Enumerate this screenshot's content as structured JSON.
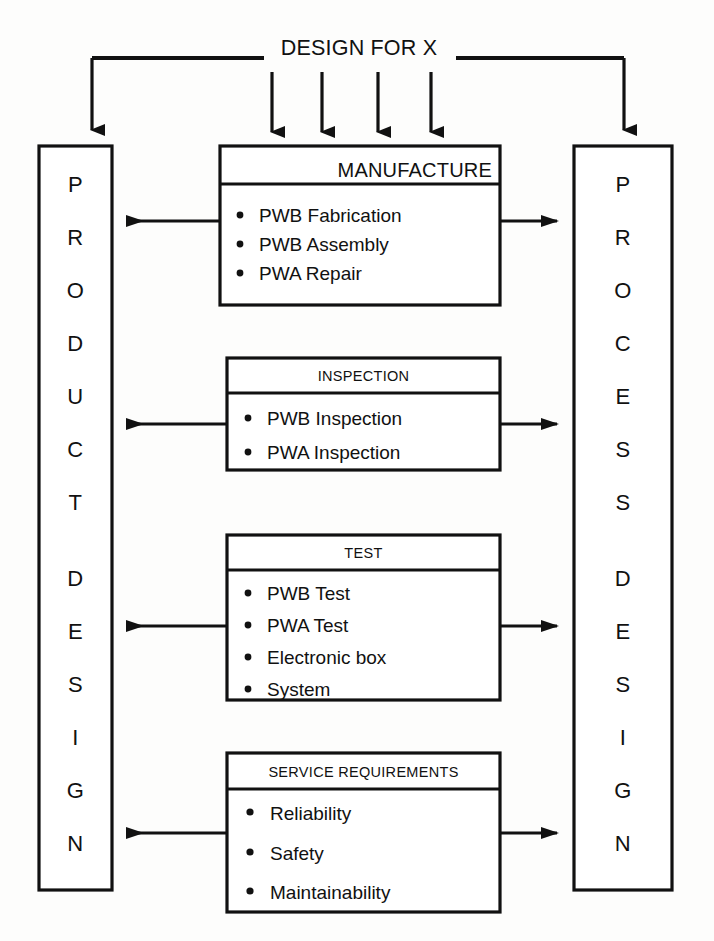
{
  "diagram": {
    "title": "DESIGN FOR X",
    "left_column": {
      "name": "product-design-column",
      "label": "PRODUCT DESIGN",
      "letters": [
        "P",
        "R",
        "O",
        "D",
        "U",
        "C",
        "T",
        "D",
        "E",
        "S",
        "I",
        "G",
        "N"
      ]
    },
    "right_column": {
      "name": "process-design-column",
      "label": "PROCESS DESIGN",
      "letters": [
        "P",
        "R",
        "O",
        "C",
        "E",
        "S",
        "S",
        "D",
        "E",
        "S",
        "I",
        "G",
        "N"
      ]
    },
    "center_boxes": [
      {
        "header": "MANUFACTURE",
        "header_align": "right",
        "header_size": "large",
        "items": [
          "PWB Fabrication",
          "PWB Assembly",
          "PWA Repair"
        ]
      },
      {
        "header": "INSPECTION",
        "header_align": "center",
        "header_size": "small",
        "items": [
          "PWB Inspection",
          "PWA Inspection"
        ]
      },
      {
        "header": "TEST",
        "header_align": "center",
        "header_size": "small",
        "items": [
          "PWB Test",
          "PWA Test",
          "Electronic box",
          "System"
        ]
      },
      {
        "header": "SERVICE REQUIREMENTS",
        "header_align": "center",
        "header_size": "small",
        "items": [
          "Reliability",
          "Safety",
          "Maintainability"
        ]
      }
    ],
    "colors": {
      "ink": "#111111",
      "paper": "#fdfdfc",
      "box_fill": "#ffffff"
    },
    "arrow_counts": {
      "title_down_arrows_to_manufacture": 4,
      "title_down_arrows_to_columns": 2,
      "box_to_left_column": 4,
      "box_to_right_column": 4
    }
  }
}
